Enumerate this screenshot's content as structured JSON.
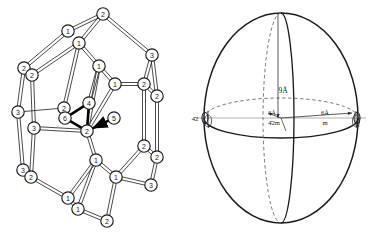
{
  "figure": {
    "title": "",
    "panels": [
      {
        "id": "left",
        "name": "polyhedral-cluster-diagram"
      },
      {
        "id": "right",
        "name": "ellipsoid-symmetry-diagram"
      }
    ]
  },
  "colors": {
    "ink": "#1a1a1a",
    "line": "#2b2b2b",
    "grey_line": "#8f8f8f",
    "dashed": "#6d6d6d",
    "node_fill": "#ffffff",
    "bold_bond": "#000000",
    "background": "#ffffff"
  },
  "cluster": {
    "name": "polyhedral-cluster-diagram",
    "node_radius": 6.2,
    "nodes": [
      {
        "id": "n1",
        "label": "2",
        "x": 103,
        "y": 14
      },
      {
        "id": "n2",
        "label": "1",
        "x": 68,
        "y": 31
      },
      {
        "id": "n3",
        "label": "1",
        "x": 79,
        "y": 43
      },
      {
        "id": "n4",
        "label": "3",
        "x": 152,
        "y": 55
      },
      {
        "id": "n5",
        "label": "2",
        "x": 24,
        "y": 68
      },
      {
        "id": "n6",
        "label": "2",
        "x": 32,
        "y": 75
      },
      {
        "id": "n7",
        "label": "1",
        "x": 99,
        "y": 66
      },
      {
        "id": "n8",
        "label": "1",
        "x": 115,
        "y": 84
      },
      {
        "id": "n9",
        "label": "2",
        "x": 144,
        "y": 84
      },
      {
        "id": "n10",
        "label": "2",
        "x": 157,
        "y": 96
      },
      {
        "id": "n11",
        "label": "3",
        "x": 18,
        "y": 112
      },
      {
        "id": "n12",
        "label": "2",
        "x": 64,
        "y": 108
      },
      {
        "id": "n13",
        "label": "4",
        "x": 89,
        "y": 103
      },
      {
        "id": "n14",
        "label": "6",
        "x": 65,
        "y": 118
      },
      {
        "id": "n15",
        "label": "5",
        "x": 114,
        "y": 118
      },
      {
        "id": "n16",
        "label": "3",
        "x": 34,
        "y": 128
      },
      {
        "id": "n17",
        "label": "2",
        "x": 87,
        "y": 131
      },
      {
        "id": "n18",
        "label": "2",
        "x": 144,
        "y": 146
      },
      {
        "id": "n19",
        "label": "2",
        "x": 157,
        "y": 157
      },
      {
        "id": "n20",
        "label": "3",
        "x": 23,
        "y": 170
      },
      {
        "id": "n21",
        "label": "2",
        "x": 31,
        "y": 177
      },
      {
        "id": "n22",
        "label": "1",
        "x": 96,
        "y": 160
      },
      {
        "id": "n23",
        "label": "1",
        "x": 116,
        "y": 177
      },
      {
        "id": "n24",
        "label": "3",
        "x": 151,
        "y": 185
      },
      {
        "id": "n25",
        "label": "1",
        "x": 68,
        "y": 198
      },
      {
        "id": "n26",
        "label": "1",
        "x": 78,
        "y": 209
      },
      {
        "id": "n27",
        "label": "2",
        "x": 107,
        "y": 221
      }
    ],
    "bonds": [
      {
        "from": "n1",
        "to": "n2",
        "style": "double"
      },
      {
        "from": "n1",
        "to": "n3",
        "style": "double"
      },
      {
        "from": "n1",
        "to": "n4",
        "style": "double"
      },
      {
        "from": "n2",
        "to": "n5",
        "style": "double"
      },
      {
        "from": "n3",
        "to": "n6",
        "style": "double"
      },
      {
        "from": "n3",
        "to": "n7",
        "style": "double"
      },
      {
        "from": "n3",
        "to": "n12",
        "style": "double"
      },
      {
        "from": "n4",
        "to": "n9",
        "style": "double"
      },
      {
        "from": "n4",
        "to": "n10",
        "style": "double"
      },
      {
        "from": "n5",
        "to": "n11",
        "style": "double"
      },
      {
        "from": "n6",
        "to": "n16",
        "style": "double"
      },
      {
        "from": "n7",
        "to": "n8",
        "style": "double"
      },
      {
        "from": "n7",
        "to": "n13",
        "style": "double"
      },
      {
        "from": "n7",
        "to": "n17",
        "style": "double"
      },
      {
        "from": "n8",
        "to": "n9",
        "style": "double"
      },
      {
        "from": "n8",
        "to": "n17",
        "style": "double"
      },
      {
        "from": "n9",
        "to": "n10",
        "style": "double"
      },
      {
        "from": "n9",
        "to": "n18",
        "style": "double"
      },
      {
        "from": "n10",
        "to": "n19",
        "style": "double"
      },
      {
        "from": "n11",
        "to": "n12",
        "style": "single"
      },
      {
        "from": "n11",
        "to": "n20",
        "style": "double"
      },
      {
        "from": "n12",
        "to": "n14",
        "style": "single"
      },
      {
        "from": "n13",
        "to": "n14",
        "style": "bold"
      },
      {
        "from": "n13",
        "to": "n17",
        "style": "bold"
      },
      {
        "from": "n14",
        "to": "n17",
        "style": "bold"
      },
      {
        "from": "n15",
        "to": "n17",
        "style": "bold-arrow"
      },
      {
        "from": "n16",
        "to": "n17",
        "style": "double"
      },
      {
        "from": "n16",
        "to": "n21",
        "style": "double"
      },
      {
        "from": "n17",
        "to": "n22",
        "style": "double"
      },
      {
        "from": "n18",
        "to": "n19",
        "style": "double"
      },
      {
        "from": "n18",
        "to": "n23",
        "style": "double"
      },
      {
        "from": "n19",
        "to": "n24",
        "style": "double"
      },
      {
        "from": "n20",
        "to": "n21",
        "style": "double"
      },
      {
        "from": "n21",
        "to": "n25",
        "style": "double"
      },
      {
        "from": "n22",
        "to": "n23",
        "style": "double"
      },
      {
        "from": "n22",
        "to": "n25",
        "style": "double"
      },
      {
        "from": "n22",
        "to": "n26",
        "style": "double"
      },
      {
        "from": "n23",
        "to": "n24",
        "style": "double"
      },
      {
        "from": "n23",
        "to": "n27",
        "style": "double"
      },
      {
        "from": "n25",
        "to": "n26",
        "style": "double"
      },
      {
        "from": "n26",
        "to": "n27",
        "style": "double"
      }
    ]
  },
  "ellipsoid": {
    "name": "ellipsoid-symmetry-diagram",
    "center": {
      "x": 281,
      "y": 118
    },
    "semi_axis_x": 77,
    "semi_axis_y": 105,
    "labels": {
      "vertical_axis": "9Å",
      "center_upper": "3Å",
      "center_lower": "4̄2m",
      "right_upper": "6Å",
      "right_lower": "m",
      "left_outer": "4̄2"
    },
    "symmetry_markers": [
      {
        "id": "left-marker",
        "x": 200,
        "y": 118
      },
      {
        "id": "right-marker",
        "x": 363,
        "y": 118
      }
    ]
  }
}
